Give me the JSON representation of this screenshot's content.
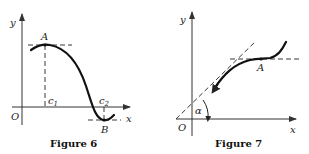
{
  "figures": [
    {
      "caption": "Figure 6",
      "labels": {
        "y_axis": "y",
        "x_axis": "x",
        "origin": "O",
        "point_max": "A",
        "point_min": "B",
        "c1": "c",
        "c1_sub": "1",
        "c2": "c",
        "c2_sub": "2"
      },
      "description": "Curve with horizontal tangent at local maximum A above c1 and local minimum B below x-axis at c2"
    },
    {
      "caption": "Figure 7",
      "labels": {
        "y_axis": "y",
        "x_axis": "x",
        "origin": "O",
        "point": "A",
        "angle": "α"
      },
      "description": "Increasing curve with horizontal tangent at inflection point A; dashed tangent line at angle α to x-axis"
    }
  ]
}
